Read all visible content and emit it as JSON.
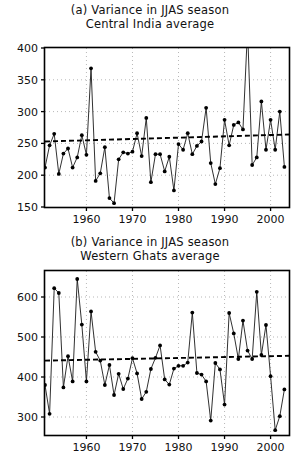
{
  "figure": {
    "width": 300,
    "height": 468,
    "background": "#ffffff",
    "ink": "#000000"
  },
  "panels": [
    {
      "id": "panel-a",
      "title_lines": [
        "(a) Variance in JJAS season",
        "Central India average"
      ]
    },
    {
      "id": "panel-b",
      "title_lines": [
        "(b) Variance in JJAS season",
        "Western Ghats average"
      ]
    }
  ],
  "chart_data": [
    {
      "type": "line",
      "panel": "a",
      "title": "(a) Variance in JJAS season  Central India average",
      "subtitle": "Central India average",
      "xlabel": "",
      "ylabel": "",
      "xlim": [
        1951,
        2004
      ],
      "ylim": [
        150,
        400
      ],
      "xticks": [
        1960,
        1970,
        1980,
        1990,
        2000
      ],
      "yticks": [
        150,
        200,
        250,
        300,
        350,
        400
      ],
      "grid": true,
      "grid_style": "dotted",
      "marker": "filled-circle",
      "legend": null,
      "series": [
        {
          "name": "Central India JJAS variance",
          "x": [
            1951,
            1952,
            1953,
            1954,
            1955,
            1956,
            1957,
            1958,
            1959,
            1960,
            1961,
            1962,
            1963,
            1964,
            1965,
            1966,
            1967,
            1968,
            1969,
            1970,
            1971,
            1972,
            1973,
            1974,
            1975,
            1976,
            1977,
            1978,
            1979,
            1980,
            1981,
            1982,
            1983,
            1984,
            1985,
            1986,
            1987,
            1988,
            1989,
            1990,
            1991,
            1992,
            1993,
            1994,
            1995,
            1996,
            1997,
            1998,
            1999,
            2000,
            2001,
            2002,
            2003
          ],
          "values": [
            212,
            247,
            265,
            202,
            234,
            242,
            212,
            228,
            263,
            232,
            368,
            191,
            203,
            244,
            164,
            156,
            225,
            236,
            234,
            237,
            266,
            230,
            290,
            189,
            233,
            233,
            206,
            229,
            176,
            249,
            240,
            266,
            233,
            246,
            253,
            306,
            219,
            186,
            211,
            287,
            247,
            279,
            283,
            272,
            430,
            216,
            228,
            316,
            240,
            287,
            240,
            300,
            213,
            232
          ]
        }
      ],
      "trend_line": {
        "style": "dashed",
        "x": [
          1951,
          2004
        ],
        "y": [
          253,
          264
        ]
      }
    },
    {
      "type": "line",
      "panel": "b",
      "title": "(b) Variance in JJAS season  Western Ghats average",
      "subtitle": "Western Ghats average",
      "xlabel": "",
      "ylabel": "",
      "xlim": [
        1951,
        2004
      ],
      "ylim": [
        255,
        665
      ],
      "xticks": [
        1960,
        1970,
        1980,
        1990,
        2000
      ],
      "yticks": [
        300,
        400,
        500,
        600
      ],
      "grid": true,
      "grid_style": "dotted",
      "marker": "filled-circle",
      "legend": null,
      "series": [
        {
          "name": "Western Ghats JJAS variance",
          "x": [
            1951,
            1952,
            1953,
            1954,
            1955,
            1956,
            1957,
            1958,
            1959,
            1960,
            1961,
            1962,
            1963,
            1964,
            1965,
            1966,
            1967,
            1968,
            1969,
            1970,
            1971,
            1972,
            1973,
            1974,
            1975,
            1976,
            1977,
            1978,
            1979,
            1980,
            1981,
            1982,
            1983,
            1984,
            1985,
            1986,
            1987,
            1988,
            1989,
            1990,
            1991,
            1992,
            1993,
            1994,
            1995,
            1996,
            1997,
            1998,
            1999,
            2000,
            2001,
            2002,
            2003
          ],
          "values": [
            380,
            308,
            622,
            610,
            374,
            452,
            389,
            645,
            531,
            389,
            564,
            463,
            441,
            380,
            430,
            355,
            408,
            370,
            396,
            447,
            409,
            345,
            363,
            420,
            448,
            479,
            394,
            381,
            421,
            428,
            428,
            436,
            561,
            410,
            406,
            389,
            291,
            435,
            419,
            331,
            560,
            509,
            445,
            541,
            466,
            445,
            613,
            455,
            530,
            402,
            267,
            302,
            369,
            435
          ]
        }
      ],
      "trend_line": {
        "style": "dashed",
        "x": [
          1951,
          2004
        ],
        "y": [
          441,
          453
        ]
      }
    }
  ]
}
